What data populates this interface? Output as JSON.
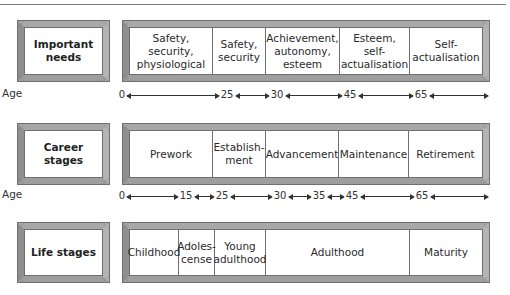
{
  "diagram": {
    "rows": [
      {
        "label": "Important\nneeds",
        "stages": [
          {
            "text": "Safety, security,\nphysiological",
            "width": 83
          },
          {
            "text": "Safety,\nsecurity",
            "width": 53
          },
          {
            "text": "Achievement,\nautonomy,\nesteem",
            "width": 74
          },
          {
            "text": "Esteem, self-\nactualisation",
            "width": 70
          },
          {
            "text": "Self-\nactualisation",
            "width": 73
          }
        ],
        "axis": {
          "label": "Age",
          "ticks": [
            "0",
            "25",
            "30",
            "45",
            "65"
          ],
          "positions": [
            0,
            105,
            155,
            228,
            299
          ],
          "end": 368
        }
      },
      {
        "label": "Career stages",
        "stages": [
          {
            "text": "Prework",
            "width": 83
          },
          {
            "text": "Establish-\nment",
            "width": 53
          },
          {
            "text": "Advancement",
            "width": 73
          },
          {
            "text": "Maintenance",
            "width": 70
          },
          {
            "text": "Retirement",
            "width": 74
          }
        ],
        "axis": {
          "label": "Age",
          "ticks": [
            "0",
            "15",
            "25",
            "30",
            "35",
            "45",
            "65"
          ],
          "positions": [
            0,
            64,
            100,
            158,
            197,
            230,
            300
          ],
          "end": 368
        }
      },
      {
        "label": "Life stages",
        "stages": [
          {
            "text": "Childhood",
            "width": 49
          },
          {
            "text": "Adoles-\ncense",
            "width": 36
          },
          {
            "text": "Young\nadulthood",
            "width": 51
          },
          {
            "text": "Adulthood",
            "width": 144
          },
          {
            "text": "Maturity",
            "width": 73
          }
        ]
      }
    ]
  }
}
